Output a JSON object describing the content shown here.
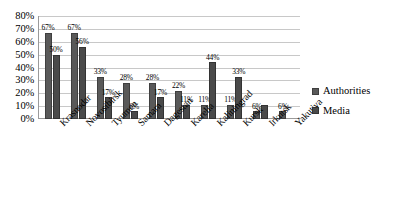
{
  "chart_data": {
    "type": "bar",
    "title": "",
    "xlabel": "",
    "ylabel": "",
    "ylim": [
      0,
      80
    ],
    "grid": true,
    "legend_position": "right",
    "categories": [
      "Krasnodar",
      "Novosibirsk",
      "Tyumen",
      "Samara",
      "Dagestan",
      "Karelia",
      "Kaliningrad",
      "Kursk",
      "Irkutsk",
      "Yakutiya"
    ],
    "y_ticks": [
      "0%",
      "10%",
      "20%",
      "30%",
      "40%",
      "50%",
      "60%",
      "70%",
      "80%"
    ],
    "y_tick_values": [
      0,
      10,
      20,
      30,
      40,
      50,
      60,
      70,
      80
    ],
    "series": [
      {
        "name": "Authorities",
        "color": "#595959",
        "values": [
          67,
          67,
          33,
          28,
          28,
          22,
          11,
          11,
          6,
          6
        ],
        "labels": [
          "67%",
          "67%",
          "33%",
          "28%",
          "28%",
          "22%",
          "11%",
          "11%",
          "6%",
          "6%"
        ]
      },
      {
        "name": "Media",
        "color": "#4a4a4a",
        "values": [
          50,
          56,
          17,
          6,
          17,
          11,
          44,
          33,
          11,
          0
        ],
        "labels": [
          "50%",
          "56%",
          "17%",
          "6%",
          "17%",
          "11%",
          "44%",
          "33%",
          ""
        ]
      }
    ]
  },
  "legend": {
    "items": [
      {
        "label": "Authorities"
      },
      {
        "label": "Media"
      }
    ]
  }
}
